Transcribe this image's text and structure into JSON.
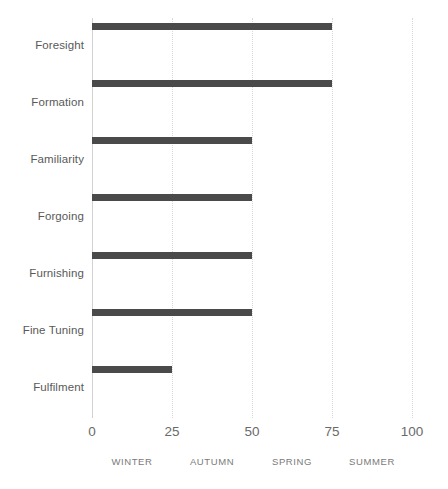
{
  "chart_data": {
    "type": "bar",
    "orientation": "horizontal",
    "title": "",
    "subtitle": "",
    "xlabel": "",
    "ylabel": "",
    "categories": [
      "Foresight",
      "Formation",
      "Familiarity",
      "Forgoing",
      "Furnishing",
      "Fine Tuning",
      "Fulfilment"
    ],
    "values": [
      75,
      75,
      50,
      50,
      50,
      50,
      25
    ],
    "series": [
      {
        "name": "",
        "values": [
          75,
          75,
          50,
          50,
          50,
          50,
          25
        ]
      }
    ],
    "xlim": [
      0,
      100
    ],
    "xticks": [
      0,
      25,
      50,
      75,
      100
    ],
    "xtick_labels": [
      "0",
      "25",
      "50",
      "75",
      "100"
    ],
    "grid": true,
    "grid_axis": "x",
    "grid_style": "dotted",
    "legend": false,
    "legend_position": "none",
    "bar_color": "#4a4a4a",
    "axis_color": "#d2d2d2",
    "gridline_color": "#d8d8d8",
    "label_color": "#595959",
    "tick_label_color": "#6a6a6a",
    "band_label_color": "#7a7a7a",
    "background_color": "#ffffff",
    "band_labels": [
      {
        "label": "WINTER",
        "range": [
          0,
          25
        ]
      },
      {
        "label": "AUTUMN",
        "range": [
          25,
          50
        ]
      },
      {
        "label": "SPRING",
        "range": [
          50,
          75
        ]
      },
      {
        "label": "SUMMER",
        "range": [
          75,
          100
        ]
      }
    ],
    "annotations": []
  }
}
